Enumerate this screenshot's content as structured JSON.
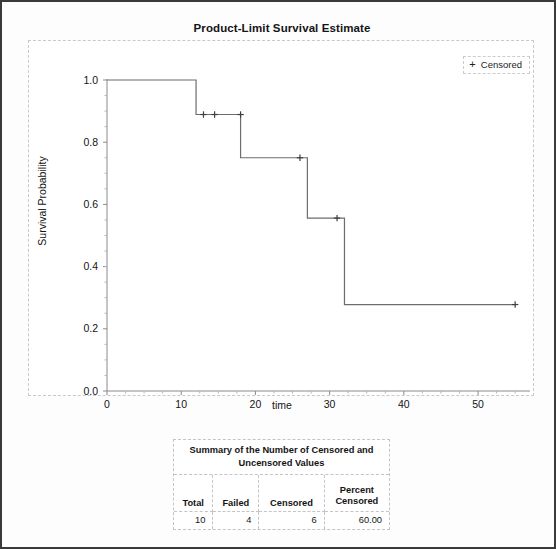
{
  "chart": {
    "title": "Product-Limit Survival Estimate",
    "legend": {
      "symbol": "+",
      "label": "Censored"
    },
    "xlabel": "time",
    "ylabel": "Survival Probability"
  },
  "table": {
    "caption": "Summary of the Number of Censored and Uncensored Values",
    "headers": [
      "Total",
      "Failed",
      "Censored",
      "Percent Censored"
    ],
    "header_percent_line1": "Percent",
    "header_percent_line2": "Censored",
    "row": [
      "10",
      "4",
      "6",
      "60.00"
    ]
  },
  "chart_data": {
    "type": "line",
    "title": "Product-Limit Survival Estimate",
    "xlabel": "time",
    "ylabel": "Survival Probability",
    "xlim": [
      0,
      57
    ],
    "ylim": [
      0,
      1.0
    ],
    "xticks": [
      0,
      10,
      20,
      30,
      40,
      50
    ],
    "yticks": [
      0.0,
      0.2,
      0.4,
      0.6,
      0.8,
      1.0
    ],
    "ytick_labels": [
      "0.0",
      "0.2",
      "0.4",
      "0.6",
      "0.8",
      "1.0"
    ],
    "xtick_labels": [
      "0",
      "10",
      "20",
      "30",
      "40",
      "50"
    ],
    "grid": false,
    "legend": [
      "Censored"
    ],
    "legend_position": "top-right",
    "series": [
      {
        "name": "Survival function",
        "style": "step-post",
        "points": [
          {
            "time": 0,
            "survival": 1.0
          },
          {
            "time": 12,
            "survival": 1.0
          },
          {
            "time": 12,
            "survival": 0.889
          },
          {
            "time": 18,
            "survival": 0.889
          },
          {
            "time": 18,
            "survival": 0.75
          },
          {
            "time": 27,
            "survival": 0.75
          },
          {
            "time": 27,
            "survival": 0.556
          },
          {
            "time": 32,
            "survival": 0.556
          },
          {
            "time": 32,
            "survival": 0.278
          },
          {
            "time": 55,
            "survival": 0.278
          }
        ]
      },
      {
        "name": "Censored",
        "style": "plus-marks",
        "points": [
          {
            "time": 13,
            "survival": 0.889
          },
          {
            "time": 14.5,
            "survival": 0.889
          },
          {
            "time": 18,
            "survival": 0.889
          },
          {
            "time": 26,
            "survival": 0.75
          },
          {
            "time": 31,
            "survival": 0.556
          },
          {
            "time": 55,
            "survival": 0.278
          }
        ]
      }
    ]
  }
}
